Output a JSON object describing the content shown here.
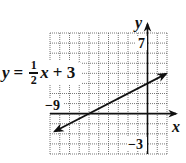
{
  "chart_data": {
    "type": "line",
    "title": "",
    "equation": "y = 1/2 x + 3",
    "equation_parts": {
      "lhs": "y",
      "equals": "=",
      "numerator": "1",
      "denominator": "2",
      "variable": "x",
      "rest": "+ 3"
    },
    "xlabel": "x",
    "ylabel": "y",
    "xlim": [
      -10,
      2
    ],
    "ylim": [
      -4,
      8
    ],
    "grid": true,
    "grid_step": 1,
    "tick_labels": {
      "x": [
        {
          "value": -9,
          "label": "−9"
        }
      ],
      "y": [
        {
          "value": 7,
          "label": "7"
        },
        {
          "value": -3,
          "label": "−3"
        }
      ]
    },
    "series": [
      {
        "name": "y = 1/2 x + 3",
        "slope": 0.5,
        "intercept": 3,
        "x": [
          -9.5,
          1.9
        ],
        "y": [
          -1.75,
          3.95
        ],
        "arrows": "both"
      }
    ],
    "legend": "none"
  },
  "labels": {
    "x_axis": "x",
    "y_axis": "y",
    "tick_x_neg9": "−9",
    "tick_y_7": "7",
    "tick_y_neg3": "−3"
  },
  "colors": {
    "grid": "#555555",
    "axis": "#111111",
    "line": "#111111",
    "background": "#ffffff"
  }
}
